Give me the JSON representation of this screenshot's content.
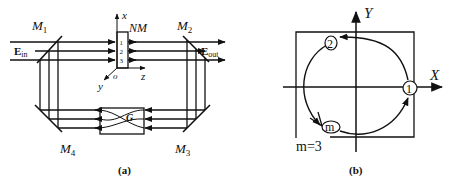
{
  "panel_a": {
    "caption": "(a)",
    "mirrors": {
      "m1": {
        "letter": "M",
        "sub": "1"
      },
      "m2": {
        "letter": "M",
        "sub": "2"
      },
      "m3": {
        "letter": "M",
        "sub": "3"
      },
      "m4": {
        "letter": "M",
        "sub": "4"
      }
    },
    "input_label": {
      "main": "E",
      "sub": "in"
    },
    "output_label": {
      "main": "E",
      "sub": "out"
    },
    "medium_label": "NM",
    "channels": [
      "1",
      "2",
      "3"
    ],
    "axes": {
      "x": "x",
      "y": "y",
      "z": "z",
      "origin": "o"
    },
    "element_g": "G"
  },
  "panel_b": {
    "caption": "(b)",
    "axis_x": "X",
    "axis_y": "Y",
    "points": {
      "p1": "1",
      "p2": "2",
      "pm": "m"
    },
    "annotation": "m=3"
  },
  "colors": {
    "line": "#111111",
    "background": "#ffffff"
  }
}
